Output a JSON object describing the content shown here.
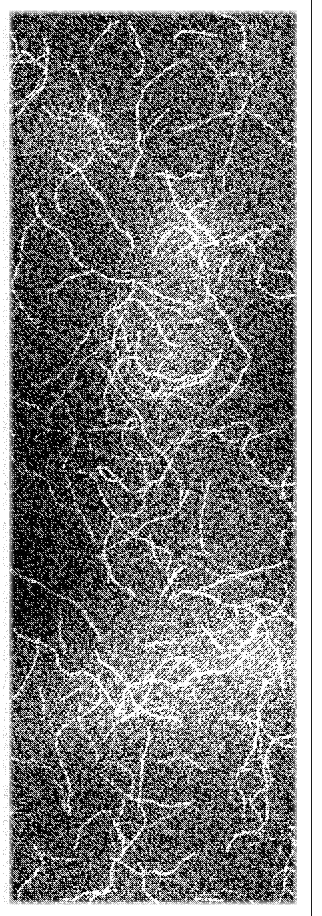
{
  "page": {
    "width_px": 322,
    "height_px": 916,
    "background_color": "#ffffff",
    "kind": "scanned-document-page-fragment",
    "visible_text": ""
  },
  "figure": {
    "name": "halftone-noise-field",
    "x_px": 9,
    "y_px": 10,
    "width_px": 288,
    "height_px": 895,
    "dominant_colors": {
      "ink": "#0d0d0d",
      "paper": "#f4f4f4",
      "midtone": "#8a8a8a"
    },
    "mean_luminance": 0.42,
    "contrast": "high",
    "grain": "coarse 1-2px dithered halftone",
    "structure": "filamentary / cosmic-web, bright strands over dark background"
  },
  "column_rule": {
    "name": "vertical-column-rule",
    "x_px": 311,
    "width_px": 1,
    "height_px": 916,
    "color": "#1c1c1c"
  },
  "render": {
    "seed": 20240517,
    "cell_px": 2,
    "blob_count": 26,
    "filament_count": 120
  }
}
